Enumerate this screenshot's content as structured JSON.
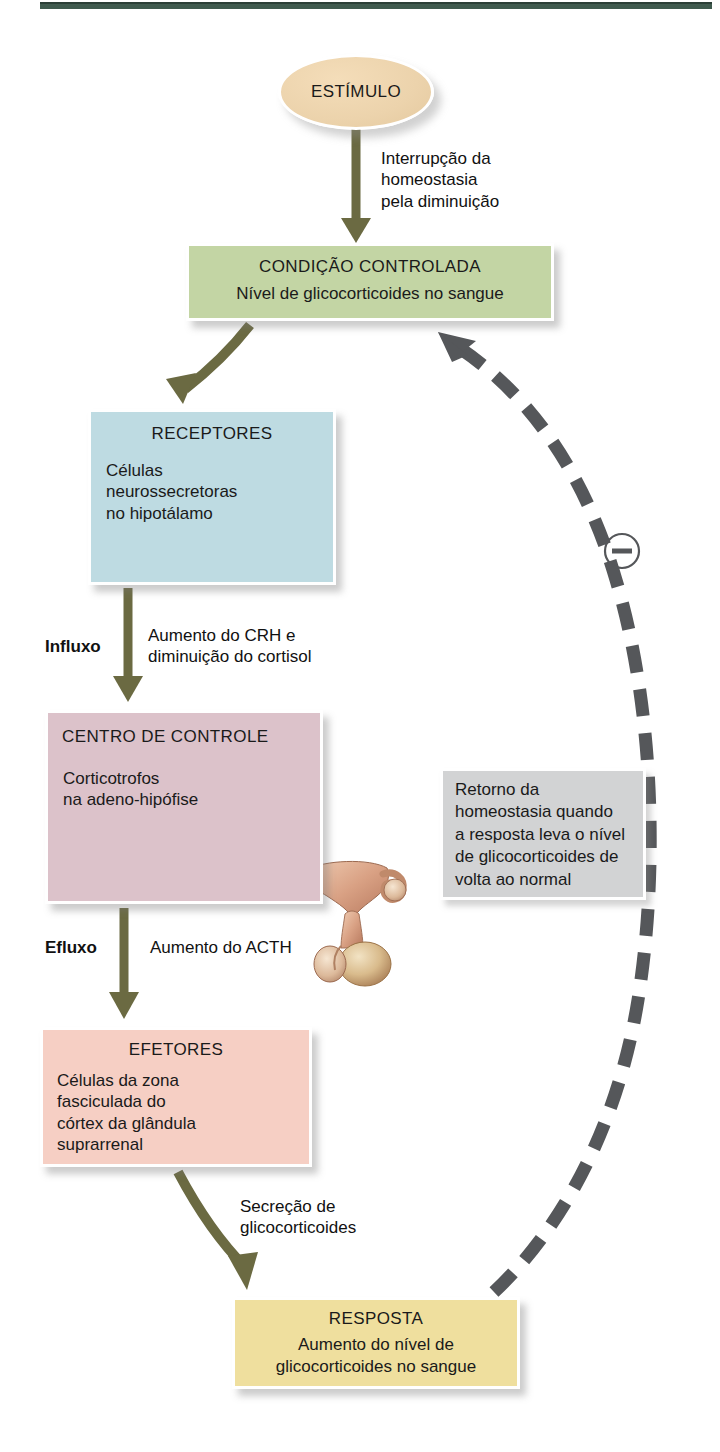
{
  "diagram": {
    "nodes": {
      "estimulo": {
        "title": "ESTÍMULO",
        "fill": "#ecd3ac"
      },
      "condicao": {
        "title": "CONDIÇÃO CONTROLADA",
        "body": "Nível de glicocorticoides no sangue",
        "fill": "#c3d5a4"
      },
      "receptores": {
        "title": "RECEPTORES",
        "body": "Células\nneurossecretoras\nno hipotálamo",
        "fill": "#bedbe2",
        "illustration": "hypothalamus-pituitary-illustration"
      },
      "centro": {
        "title": "CENTRO DE CONTROLE",
        "body": "Corticotrofos\nna adeno-hipófise",
        "fill": "#dcc2ca",
        "illustration": "hypothalamus-pituitary-illustration"
      },
      "efetores": {
        "title": "EFETORES",
        "body": "Células da zona\nfasciculada do\ncórtex da glândula\nsuprarrenal",
        "fill": "#f6cfc4",
        "illustration": "adrenal-cortex-illustration"
      },
      "resposta": {
        "title": "RESPOSTA",
        "body": "Aumento do nível de\nglicocorticoides no sangue",
        "fill": "#efdf9e"
      },
      "retorno": {
        "body": "Retorno da\nhomeostasia quando\na resposta leva o nível\nde glicocorticoides de\nvolta ao normal",
        "fill": "#d2d3d4"
      }
    },
    "labels": {
      "interrupcao": "Interrupção da\nhomeostasia\npela diminuição",
      "influxo": "Influxo",
      "crh": "Aumento do CRH e\ndiminuição do cortisol",
      "efluxo": "Efluxo",
      "acth": "Aumento do ACTH",
      "secrecao": "Secreção de\nglicocorticoides",
      "feedback_sign": "−"
    },
    "colors": {
      "arrow_olive": "#6b6a42",
      "feedback_gray": "#55575a",
      "top_rule": "#3f5a4e"
    }
  }
}
